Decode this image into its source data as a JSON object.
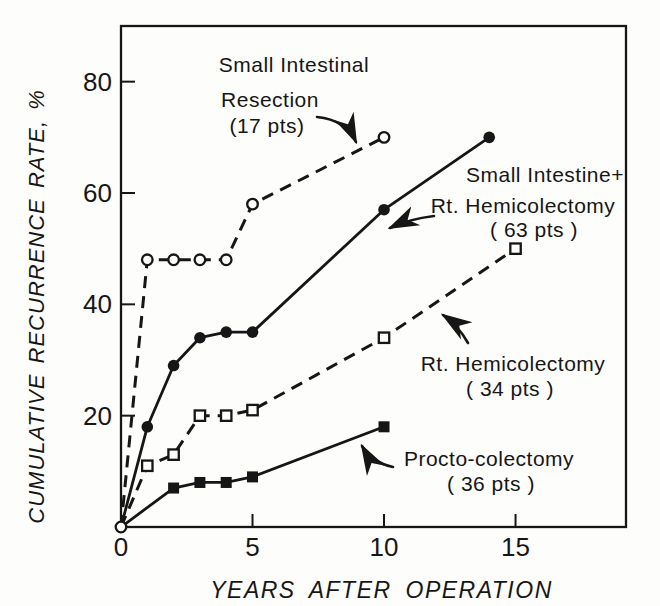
{
  "figure": {
    "background": "#fdfdfc",
    "ink": "#161616"
  },
  "chart_data": {
    "type": "line",
    "title": "",
    "xlabel": "YEARS AFTER OPERATION",
    "ylabel": "CUMULATIVE RECURRENCE RATE, %",
    "xlim": [
      0,
      19.2
    ],
    "ylim": [
      0,
      90
    ],
    "xticks": [
      0,
      5,
      10,
      15
    ],
    "yticks": [
      20,
      40,
      60,
      80
    ],
    "grid": false,
    "legend_position": "inline-annotations",
    "series": [
      {
        "name": "Small Intestinal Resection",
        "patients": "17 pts",
        "line_style": "dashed",
        "marker": "circle-open",
        "origin_marker": true,
        "points": [
          [
            0,
            0
          ],
          [
            1,
            48
          ],
          [
            2,
            48
          ],
          [
            3,
            48
          ],
          [
            4,
            48
          ],
          [
            5,
            58
          ],
          [
            10,
            70
          ]
        ]
      },
      {
        "name": "Small Intestine + Rt. Hemicolectomy",
        "patients": "63 pts",
        "line_style": "solid",
        "marker": "circle-filled",
        "origin_marker": false,
        "points": [
          [
            0,
            0
          ],
          [
            1,
            18
          ],
          [
            2,
            29
          ],
          [
            3,
            34
          ],
          [
            4,
            35
          ],
          [
            5,
            35
          ],
          [
            10,
            57
          ],
          [
            14,
            70
          ]
        ]
      },
      {
        "name": "Rt. Hemicolectomy",
        "patients": "34 pts",
        "line_style": "dashed",
        "marker": "square-open",
        "origin_marker": false,
        "points": [
          [
            0,
            0
          ],
          [
            1,
            11
          ],
          [
            2,
            13
          ],
          [
            3,
            20
          ],
          [
            4,
            20
          ],
          [
            5,
            21
          ],
          [
            10,
            34
          ],
          [
            15,
            50
          ]
        ]
      },
      {
        "name": "Procto-colectomy",
        "patients": "36 pts",
        "line_style": "solid",
        "marker": "square-filled",
        "origin_marker": false,
        "points": [
          [
            0,
            0
          ],
          [
            2,
            7
          ],
          [
            3,
            8
          ],
          [
            4,
            8
          ],
          [
            5,
            9
          ],
          [
            10,
            18
          ]
        ]
      }
    ],
    "annotations": [
      {
        "series": "Small Intestinal Resection",
        "lines": [
          {
            "text": "Small Intestinal",
            "x": 294,
            "y": 72
          },
          {
            "text": "Resection",
            "x": 270,
            "y": 107
          },
          {
            "text": "(17 pts)",
            "x": 267,
            "y": 133
          }
        ],
        "arrow_path": "M317,117 Q346,120 356,142"
      },
      {
        "series": "Small Intestine + Rt. Hemicolectomy",
        "lines": [
          {
            "text": "Small Intestine+",
            "x": 545,
            "y": 182
          },
          {
            "text": "Rt. Hemicolectomy",
            "x": 523,
            "y": 213
          },
          {
            "text": "( 63 pts )",
            "x": 534,
            "y": 237
          }
        ],
        "arrow_path": "M434,216 Q409,219 390,228"
      },
      {
        "series": "Rt. Hemicolectomy",
        "lines": [
          {
            "text": "Rt. Hemicolectomy",
            "x": 513,
            "y": 371
          },
          {
            "text": "( 34 pts )",
            "x": 510,
            "y": 396
          }
        ],
        "arrow_path": "M468,343 Q458,325 443,315"
      },
      {
        "series": "Procto-colectomy",
        "lines": [
          {
            "text": "Procto-colectomy",
            "x": 489,
            "y": 466
          },
          {
            "text": "( 36 pts )",
            "x": 491,
            "y": 491
          }
        ],
        "arrow_path": "M393,467 Q371,462 362,446"
      }
    ]
  }
}
